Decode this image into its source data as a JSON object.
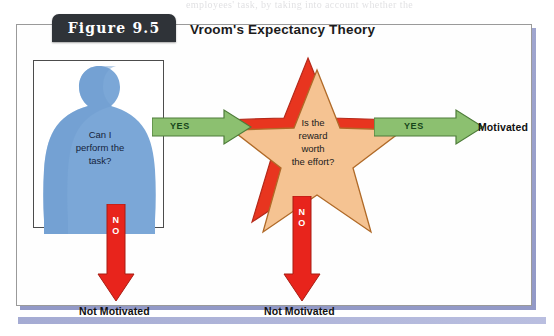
{
  "page": {
    "top_cut_text": "employees' task, by taking into account whether the",
    "bottom_band": "page-rule"
  },
  "figure": {
    "badge_label": "Figure  9.5",
    "title": "Vroom's Expectancy Theory",
    "colors": {
      "badge_bg": "#2f3338",
      "frame_border": "#9a9a9a",
      "frame_shadow": "#8f96c6",
      "person_blue": "#7ba7d7",
      "star_peach": "#f5c392",
      "star_red": "#e8351f",
      "arrow_green": "#8cc070",
      "arrow_green_border": "#4e7c3a",
      "arrow_red": "#e8241c",
      "text_dark": "#111111"
    }
  },
  "diagram": {
    "nodes": [
      {
        "id": "expectancy",
        "shape": "person-silhouette",
        "question": "Can I\nperform the\ntask?",
        "question_lines": [
          "Can I",
          "perform the",
          "task?"
        ]
      },
      {
        "id": "instrumentality",
        "shape": "star",
        "question": "Is the\nreward\nworth\nthe effort?",
        "question_lines": [
          "Is the",
          "reward",
          "worth",
          "the effort?"
        ]
      }
    ],
    "arrows": [
      {
        "id": "yes-1",
        "label": "YES",
        "direction": "right",
        "color": "green",
        "from": "expectancy",
        "to": "instrumentality"
      },
      {
        "id": "yes-2",
        "label": "YES",
        "direction": "right",
        "color": "green",
        "from": "instrumentality",
        "to": "motivated"
      },
      {
        "id": "no-1",
        "label": "NO",
        "direction": "down",
        "color": "red",
        "from": "expectancy",
        "to": "not-motivated-1"
      },
      {
        "id": "no-2",
        "label": "NO",
        "direction": "down",
        "color": "red",
        "from": "instrumentality",
        "to": "not-motivated-2"
      }
    ],
    "outcomes": [
      {
        "id": "motivated",
        "label": "Motivated"
      },
      {
        "id": "not-motivated-1",
        "label": "Not Motivated"
      },
      {
        "id": "not-motivated-2",
        "label": "Not Motivated"
      }
    ]
  }
}
